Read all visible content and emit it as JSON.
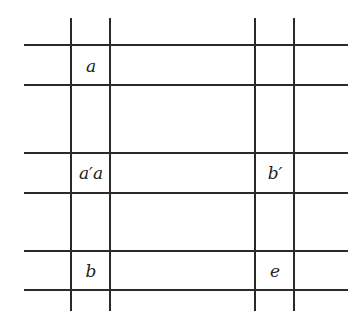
{
  "diagram": {
    "type": "grid-of-lines",
    "line_color": "#2a2a2a",
    "vertical_lines": [
      {
        "x": 71,
        "y1": 18,
        "y2": 311
      },
      {
        "x": 110,
        "y1": 18,
        "y2": 311
      },
      {
        "x": 255,
        "y1": 18,
        "y2": 311
      },
      {
        "x": 294,
        "y1": 18,
        "y2": 311
      }
    ],
    "horizontal_lines": [
      {
        "y": 45,
        "x1": 24,
        "x2": 348
      },
      {
        "y": 85,
        "x1": 24,
        "x2": 348
      },
      {
        "y": 153,
        "x1": 24,
        "x2": 348
      },
      {
        "y": 193,
        "x1": 24,
        "x2": 348
      },
      {
        "y": 251,
        "x1": 24,
        "x2": 348
      },
      {
        "y": 290,
        "x1": 24,
        "x2": 348
      }
    ],
    "labels": [
      {
        "text": "a",
        "row": 0,
        "col": 0
      },
      {
        "text": "a′a",
        "row": 1,
        "col": 0
      },
      {
        "text": "b′",
        "row": 1,
        "col": 1
      },
      {
        "text": "b",
        "row": 2,
        "col": 0
      },
      {
        "text": "e",
        "row": 2,
        "col": 1
      }
    ]
  }
}
